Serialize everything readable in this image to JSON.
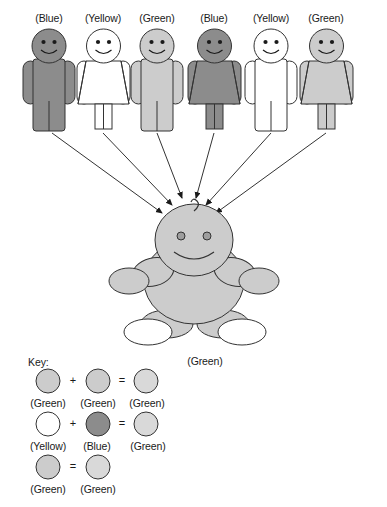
{
  "diagram": {
    "title_hidden": "",
    "parents": [
      {
        "id": "p1",
        "label": "(Blue)",
        "sex": "male",
        "fill": "#8c8c8c"
      },
      {
        "id": "p2",
        "label": "(Yellow)",
        "sex": "female",
        "fill": "#ffffff"
      },
      {
        "id": "p3",
        "label": "(Green)",
        "sex": "male",
        "fill": "#cccccc"
      },
      {
        "id": "p4",
        "label": "(Blue)",
        "sex": "female",
        "fill": "#8c8c8c"
      },
      {
        "id": "p5",
        "label": "(Yellow)",
        "sex": "male",
        "fill": "#ffffff"
      },
      {
        "id": "p6",
        "label": "(Green)",
        "sex": "female",
        "fill": "#cccccc"
      }
    ],
    "child": {
      "label": "(Green)",
      "fill": "#cccccc",
      "foot_fill": "#ffffff"
    },
    "arrow_count": 6
  },
  "key": {
    "title": "Key:",
    "rows": [
      {
        "id": "key-row-1",
        "items": [
          {
            "label": "(Green)",
            "fill": "#cccccc"
          },
          {
            "label": "(Green)",
            "fill": "#cccccc"
          },
          {
            "label": "(Green)",
            "fill": "#d9d9d9"
          }
        ],
        "operators": [
          "+",
          "="
        ]
      },
      {
        "id": "key-row-2",
        "items": [
          {
            "label": "(Yellow)",
            "fill": "#ffffff"
          },
          {
            "label": "(Blue)",
            "fill": "#8c8c8c"
          },
          {
            "label": "(Green)",
            "fill": "#d9d9d9"
          }
        ],
        "operators": [
          "+",
          "="
        ]
      },
      {
        "id": "key-row-3",
        "items": [
          {
            "label": "(Green)",
            "fill": "#cccccc"
          },
          {
            "label": "(Green)",
            "fill": "#d9d9d9"
          }
        ],
        "operators": [
          "="
        ]
      }
    ]
  },
  "colors": {
    "stroke": "#333333",
    "blue_swatch": "#8c8c8c",
    "green_swatch": "#cccccc",
    "green_light_swatch": "#d9d9d9",
    "yellow_swatch": "#ffffff",
    "background": "#ffffff"
  }
}
